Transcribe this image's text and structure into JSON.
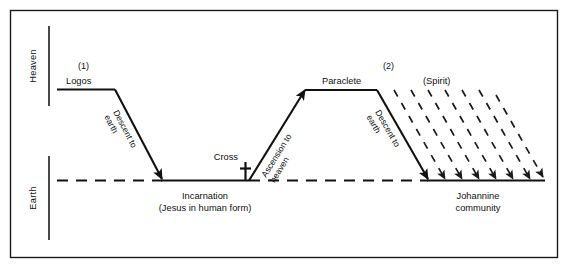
{
  "figure": {
    "title_internal": "Descent-Ascent schema of the Johannine Logos and Paraclete",
    "colors": {
      "ink": "#111111",
      "frame": "#1b1b1b",
      "background": "#ffffff"
    },
    "axis": {
      "heaven_label": "Heaven",
      "earth_label": "Earth"
    },
    "stage_one": {
      "number": "(1)",
      "plateau_label": "Logos",
      "descent_line1": "Descent to",
      "descent_line2": "earth",
      "ground_label_line1": "Incarnation",
      "ground_label_line2": "(Jesus in human form)",
      "cross_label": "Cross",
      "cross_glyph": "latin-cross",
      "ascent_line1": "Ascension to",
      "ascent_line2": "heaven"
    },
    "stage_two": {
      "number": "(2)",
      "plateau_label": "Paraclete",
      "descent_line1": "Descent to",
      "descent_line2": "earth",
      "spirit_label": "(Spirit)",
      "ground_label_line1": "Johannine",
      "ground_label_line2": "community"
    },
    "spirit_rays": {
      "count": 7,
      "style": "dashed-diagonal-arrows"
    }
  }
}
